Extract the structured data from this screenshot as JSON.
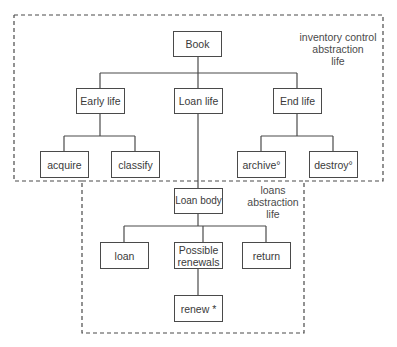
{
  "regions": {
    "inventory": {
      "label_lines": [
        "inventory control",
        "abstraction",
        "life"
      ]
    },
    "loans": {
      "label_lines": [
        "loans",
        "abstraction",
        "life"
      ]
    }
  },
  "nodes": {
    "book": "Book",
    "early_life": "Early life",
    "loan_life": "Loan life",
    "end_life": "End life",
    "acquire": "acquire",
    "classify": "classify",
    "archive": "archive°",
    "destroy": "destroy°",
    "loan_body": "Loan body",
    "loan": "loan",
    "possible_renewals": "Possible renewals",
    "return": "return",
    "renew": "renew *"
  }
}
